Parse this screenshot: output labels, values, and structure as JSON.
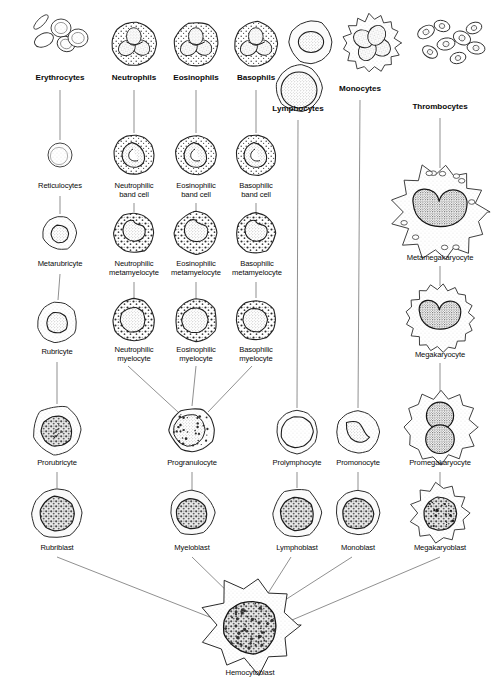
{
  "figure": {
    "type": "diagram",
    "background_color": "#ffffff",
    "ink_color": "#1a1a1a",
    "line_color": "#555555"
  },
  "columns": [
    {
      "key": "erythrocyte",
      "bold_label": "Erythrocytes",
      "stages": [
        "Erythrocytes",
        "Reticulocytes",
        "Metarubricyte",
        "Rubricyte",
        "Prorubricyte",
        "Rubriblast"
      ]
    },
    {
      "key": "neutrophil",
      "bold_label": "Neutrophils",
      "stages": [
        "Neutrophils",
        "Neutrophilic\nband cell",
        "Neutrophilic\nmetamyelocyte",
        "Neutrophilic\nmyelocyte"
      ]
    },
    {
      "key": "eosinophil",
      "bold_label": "Eosinophils",
      "stages": [
        "Eosinophils",
        "Eosinophilic\nband cell",
        "Eosinophilic\nmetamyelocyte",
        "Eosinophilic\nmyelocyte"
      ]
    },
    {
      "key": "basophil",
      "bold_label": "Basophils",
      "stages": [
        "Basophils",
        "Basophilic\nband cell",
        "Basophilic\nmetamyelocyte",
        "Basophilic\nmyelocyte"
      ]
    },
    {
      "key": "granulocyte_common",
      "bold_label": "",
      "stages": [
        "Progranulocyte",
        "Myeloblast"
      ]
    },
    {
      "key": "lymphocyte",
      "bold_label": "Lymphocytes",
      "stages": [
        "Lymphocytes",
        "Prolymphocyte",
        "Lymphoblast"
      ]
    },
    {
      "key": "monocyte",
      "bold_label": "Monocytes",
      "stages": [
        "Monocytes",
        "Promonocyte",
        "Monoblast"
      ]
    },
    {
      "key": "thrombocyte",
      "bold_label": "Thrombocytes",
      "stages": [
        "Thrombocytes",
        "Metamegakaryocyte",
        "Megakaryocyte",
        "Promegakaryocyte",
        "Megakaryoblast"
      ]
    },
    {
      "key": "stem",
      "bold_label": "",
      "stages": [
        "Hemocytoblast"
      ]
    }
  ],
  "labels": [
    {
      "id": "erythrocytes",
      "text": "Erythrocytes",
      "x": 60,
      "y": 79,
      "bold": true
    },
    {
      "id": "neutrophils",
      "text": "Neutrophils",
      "x": 134,
      "y": 79,
      "bold": true
    },
    {
      "id": "eosinophils",
      "text": "Eosinophils",
      "x": 196,
      "y": 79,
      "bold": true
    },
    {
      "id": "basophils",
      "text": "Basophils",
      "x": 256,
      "y": 79,
      "bold": true
    },
    {
      "id": "monocytes",
      "text": "Monocytes",
      "x": 360,
      "y": 90,
      "bold": true
    },
    {
      "id": "lymphocytes",
      "text": "Lymphocytes",
      "x": 298,
      "y": 110,
      "bold": true
    },
    {
      "id": "thrombocytes",
      "text": "Thrombocytes",
      "x": 440,
      "y": 108,
      "bold": true
    },
    {
      "id": "reticulocytes",
      "text": "Reticulocytes",
      "x": 60,
      "y": 186,
      "bold": false
    },
    {
      "id": "neutrophilic-band-cell",
      "text": "Neutrophilic\nband cell",
      "x": 134,
      "y": 186,
      "bold": false
    },
    {
      "id": "eosinophilic-band-cell",
      "text": "Eosinophilic\nband cell",
      "x": 196,
      "y": 186,
      "bold": false
    },
    {
      "id": "basophilic-band-cell",
      "text": "Basophilic\nband cell",
      "x": 256,
      "y": 186,
      "bold": false
    },
    {
      "id": "metamegakaryocyte",
      "text": "Metamegakaryocyte",
      "x": 440,
      "y": 258,
      "bold": false
    },
    {
      "id": "metarubricyte",
      "text": "Metarubricyte",
      "x": 60,
      "y": 264,
      "bold": false
    },
    {
      "id": "neutrophilic-metamyelocyte",
      "text": "Neutrophilic\nmetamyelocyte",
      "x": 134,
      "y": 264,
      "bold": false
    },
    {
      "id": "eosinophilic-metamyelocyte",
      "text": "Eosinophilic\nmetamyelocyte",
      "x": 196,
      "y": 264,
      "bold": false
    },
    {
      "id": "basophilic-metamyelocyte",
      "text": "Basophilic\nmetamyelocyte",
      "x": 257,
      "y": 264,
      "bold": false
    },
    {
      "id": "rubricyte",
      "text": "Rubricyte",
      "x": 57,
      "y": 352,
      "bold": false
    },
    {
      "id": "neutrophilic-myelocyte",
      "text": "Neutrophilic\nmyelocyte",
      "x": 134,
      "y": 350,
      "bold": false
    },
    {
      "id": "eosinophilic-myelocyte",
      "text": "Eosinophilic\nmyelocyte",
      "x": 196,
      "y": 350,
      "bold": false
    },
    {
      "id": "basophilic-myelocyte",
      "text": "Basophilic\nmyelocyte",
      "x": 256,
      "y": 350,
      "bold": false
    },
    {
      "id": "megakaryocyte",
      "text": "Megakaryocyte",
      "x": 440,
      "y": 355,
      "bold": false
    },
    {
      "id": "prorubricyte",
      "text": "Prorubricyte",
      "x": 57,
      "y": 463,
      "bold": false
    },
    {
      "id": "progranulocyte",
      "text": "Progranulocyte",
      "x": 192,
      "y": 463,
      "bold": false
    },
    {
      "id": "prolymphocyte",
      "text": "Prolymphocyte",
      "x": 297,
      "y": 463,
      "bold": false
    },
    {
      "id": "promonocyte",
      "text": "Promonocyte",
      "x": 358,
      "y": 463,
      "bold": false
    },
    {
      "id": "promegakaryocyte",
      "text": "Promegakaryocyte",
      "x": 440,
      "y": 463,
      "bold": false
    },
    {
      "id": "rubriblast",
      "text": "Rubriblast",
      "x": 57,
      "y": 548,
      "bold": false
    },
    {
      "id": "myeloblast",
      "text": "Myeloblast",
      "x": 192,
      "y": 548,
      "bold": false
    },
    {
      "id": "lymphoblast",
      "text": "Lymphoblast",
      "x": 297,
      "y": 548,
      "bold": false
    },
    {
      "id": "monoblast",
      "text": "Monoblast",
      "x": 358,
      "y": 548,
      "bold": false
    },
    {
      "id": "megakaryoblast",
      "text": "Megakaryoblast",
      "x": 440,
      "y": 548,
      "bold": false
    },
    {
      "id": "hemocytoblast",
      "text": "Hemocytoblast",
      "x": 250,
      "y": 673,
      "bold": false
    }
  ],
  "cells": [
    {
      "id": "erythrocytes-cluster",
      "x": 62,
      "y": 42,
      "r": 30,
      "kind": "erythrocyte-cluster"
    },
    {
      "id": "neutrophil-mature",
      "x": 134,
      "y": 44,
      "r": 22,
      "kind": "segmented-granulocyte"
    },
    {
      "id": "eosinophil-mature",
      "x": 196,
      "y": 44,
      "r": 22,
      "kind": "segmented-granulocyte"
    },
    {
      "id": "basophil-mature",
      "x": 256,
      "y": 44,
      "r": 22,
      "kind": "segmented-granulocyte"
    },
    {
      "id": "lymphocyte-small",
      "x": 311,
      "y": 42,
      "r": 21,
      "kind": "lymphocyte"
    },
    {
      "id": "lymphocyte-large",
      "x": 299,
      "y": 88,
      "r": 23,
      "kind": "lymphocyte-large"
    },
    {
      "id": "monocyte-mature",
      "x": 372,
      "y": 43,
      "r": 27,
      "kind": "monocyte"
    },
    {
      "id": "thrombocyte-cluster",
      "x": 452,
      "y": 44,
      "r": 34,
      "kind": "platelet-cluster"
    },
    {
      "id": "reticulocyte",
      "x": 60,
      "y": 155,
      "r": 12,
      "kind": "reticulocyte"
    },
    {
      "id": "neutrophil-band",
      "x": 134,
      "y": 155,
      "r": 20,
      "kind": "band-granulocyte"
    },
    {
      "id": "eosinophil-band",
      "x": 196,
      "y": 155,
      "r": 20,
      "kind": "band-granulocyte"
    },
    {
      "id": "basophil-band",
      "x": 256,
      "y": 155,
      "r": 20,
      "kind": "band-granulocyte"
    },
    {
      "id": "metamegakaryocyte-cell",
      "x": 440,
      "y": 212,
      "r": 43,
      "kind": "megakaryocyte-large"
    },
    {
      "id": "metarubricyte-cell",
      "x": 60,
      "y": 233,
      "r": 17,
      "kind": "nucleated-rbc"
    },
    {
      "id": "neutrophil-metamyelocyte",
      "x": 134,
      "y": 233,
      "r": 20,
      "kind": "metamyelocyte"
    },
    {
      "id": "eosinophil-metamyelocyte",
      "x": 196,
      "y": 233,
      "r": 21,
      "kind": "metamyelocyte"
    },
    {
      "id": "basophil-metamyelocyte",
      "x": 256,
      "y": 233,
      "r": 20,
      "kind": "metamyelocyte"
    },
    {
      "id": "rubricyte-cell",
      "x": 57,
      "y": 322,
      "r": 20,
      "kind": "nucleated-rbc"
    },
    {
      "id": "neutrophil-myelocyte",
      "x": 134,
      "y": 320,
      "r": 21,
      "kind": "myelocyte"
    },
    {
      "id": "eosinophil-myelocyte",
      "x": 196,
      "y": 320,
      "r": 21,
      "kind": "myelocyte"
    },
    {
      "id": "basophil-myelocyte",
      "x": 256,
      "y": 320,
      "r": 20,
      "kind": "myelocyte"
    },
    {
      "id": "megakaryocyte-cell",
      "x": 440,
      "y": 318,
      "r": 33,
      "kind": "megakaryocyte"
    },
    {
      "id": "prorubricyte-cell",
      "x": 57,
      "y": 430,
      "r": 24,
      "kind": "prorubricyte"
    },
    {
      "id": "progranulocyte-cell",
      "x": 192,
      "y": 430,
      "r": 22,
      "kind": "progranulocyte"
    },
    {
      "id": "prolymphocyte-cell",
      "x": 297,
      "y": 432,
      "r": 21,
      "kind": "prolymphocyte"
    },
    {
      "id": "promonocyte-cell",
      "x": 358,
      "y": 432,
      "r": 21,
      "kind": "promonocyte"
    },
    {
      "id": "promegakaryocyte-cell",
      "x": 441,
      "y": 427,
      "r": 34,
      "kind": "promegakaryocyte"
    },
    {
      "id": "rubriblast-cell",
      "x": 57,
      "y": 513,
      "r": 25,
      "kind": "blast"
    },
    {
      "id": "myeloblast-cell",
      "x": 192,
      "y": 513,
      "r": 22,
      "kind": "blast"
    },
    {
      "id": "lymphoblast-cell",
      "x": 297,
      "y": 513,
      "r": 24,
      "kind": "blast"
    },
    {
      "id": "monoblast-cell",
      "x": 358,
      "y": 513,
      "r": 22,
      "kind": "blast"
    },
    {
      "id": "megakaryoblast-cell",
      "x": 440,
      "y": 513,
      "r": 27,
      "kind": "blast-spiky"
    },
    {
      "id": "hemocytoblast-cell",
      "x": 250,
      "y": 625,
      "r": 40,
      "kind": "stem-cell"
    }
  ],
  "connectors": [
    {
      "id": "c-ery-retic",
      "x1": 60,
      "y1": 90,
      "x2": 60,
      "y2": 140
    },
    {
      "id": "c-neu-band",
      "x1": 134,
      "y1": 90,
      "x2": 134,
      "y2": 133
    },
    {
      "id": "c-eos-band",
      "x1": 196,
      "y1": 90,
      "x2": 196,
      "y2": 133
    },
    {
      "id": "c-bas-band",
      "x1": 256,
      "y1": 90,
      "x2": 256,
      "y2": 133
    },
    {
      "id": "c-lymph-pro",
      "x1": 298,
      "y1": 120,
      "x2": 297,
      "y2": 408
    },
    {
      "id": "c-mono-pro",
      "x1": 360,
      "y1": 100,
      "x2": 358,
      "y2": 408
    },
    {
      "id": "c-thrombo-meta",
      "x1": 440,
      "y1": 118,
      "x2": 440,
      "y2": 168
    },
    {
      "id": "c-retic-metarub",
      "x1": 60,
      "y1": 196,
      "x2": 60,
      "y2": 214
    },
    {
      "id": "c-neuband-meta",
      "x1": 134,
      "y1": 203,
      "x2": 134,
      "y2": 212
    },
    {
      "id": "c-eosband-meta",
      "x1": 196,
      "y1": 203,
      "x2": 196,
      "y2": 212
    },
    {
      "id": "c-basband-meta",
      "x1": 256,
      "y1": 203,
      "x2": 256,
      "y2": 212
    },
    {
      "id": "c-metameg-meg",
      "x1": 440,
      "y1": 266,
      "x2": 440,
      "y2": 286
    },
    {
      "id": "c-metarub-rub",
      "x1": 60,
      "y1": 274,
      "x2": 58,
      "y2": 300
    },
    {
      "id": "c-neumeta-myelo",
      "x1": 134,
      "y1": 282,
      "x2": 134,
      "y2": 298
    },
    {
      "id": "c-eosmeta-myelo",
      "x1": 196,
      "y1": 282,
      "x2": 196,
      "y2": 298
    },
    {
      "id": "c-basmeta-myelo",
      "x1": 256,
      "y1": 282,
      "x2": 256,
      "y2": 298
    },
    {
      "id": "c-meg-promeg",
      "x1": 440,
      "y1": 363,
      "x2": 440,
      "y2": 392
    },
    {
      "id": "c-rub-prorub",
      "x1": 57,
      "y1": 362,
      "x2": 57,
      "y2": 404
    },
    {
      "id": "c-neumyelo-prog",
      "x1": 128,
      "y1": 366,
      "x2": 178,
      "y2": 412
    },
    {
      "id": "c-eosmyelo-prog",
      "x1": 196,
      "y1": 366,
      "x2": 192,
      "y2": 406
    },
    {
      "id": "c-basmyelo-prog",
      "x1": 252,
      "y1": 366,
      "x2": 208,
      "y2": 412
    },
    {
      "id": "c-prorub-rubbl",
      "x1": 57,
      "y1": 472,
      "x2": 57,
      "y2": 488
    },
    {
      "id": "c-prog-myelobl",
      "x1": 192,
      "y1": 472,
      "x2": 192,
      "y2": 490
    },
    {
      "id": "c-prolymph-lymphbl",
      "x1": 297,
      "y1": 472,
      "x2": 297,
      "y2": 488
    },
    {
      "id": "c-promono-monobl",
      "x1": 358,
      "y1": 472,
      "x2": 358,
      "y2": 490
    },
    {
      "id": "c-promeg-megbl",
      "x1": 440,
      "y1": 472,
      "x2": 440,
      "y2": 486
    },
    {
      "id": "c-rubbl-hemo",
      "x1": 57,
      "y1": 557,
      "x2": 212,
      "y2": 618
    },
    {
      "id": "c-myelobl-hemo",
      "x1": 192,
      "y1": 557,
      "x2": 236,
      "y2": 600
    },
    {
      "id": "c-lymphbl-hemo",
      "x1": 291,
      "y1": 557,
      "x2": 265,
      "y2": 598
    },
    {
      "id": "c-monobl-hemo",
      "x1": 352,
      "y1": 557,
      "x2": 285,
      "y2": 600
    },
    {
      "id": "c-megbl-hemo",
      "x1": 440,
      "y1": 557,
      "x2": 292,
      "y2": 620
    },
    {
      "id": "c-hemo-label",
      "x1": 250,
      "y1": 660,
      "x2": 250,
      "y2": 666
    }
  ]
}
